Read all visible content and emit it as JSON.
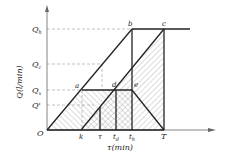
{
  "diagram": {
    "y_axis_label": "Q(l/min)",
    "x_axis_label": "τ(min)",
    "origin_label": "O",
    "y_levels": [
      {
        "id": "Qh",
        "main": "Q",
        "sub": "h"
      },
      {
        "id": "Qc",
        "main": "Q",
        "sub": "c"
      },
      {
        "id": "Qx",
        "main": "Q",
        "sub": "x"
      },
      {
        "id": "Qp",
        "main": "Q'",
        "sub": ""
      }
    ],
    "x_ticks": [
      {
        "id": "k",
        "main": "k",
        "sub": ""
      },
      {
        "id": "tau",
        "main": "τ",
        "sub": ""
      },
      {
        "id": "td",
        "main": "t",
        "sub": "d"
      },
      {
        "id": "th",
        "main": "t",
        "sub": "h"
      },
      {
        "id": "T",
        "main": "T",
        "sub": ""
      }
    ],
    "points": {
      "a": "a",
      "b": "b",
      "c": "c",
      "d": "d",
      "e": "e"
    }
  }
}
